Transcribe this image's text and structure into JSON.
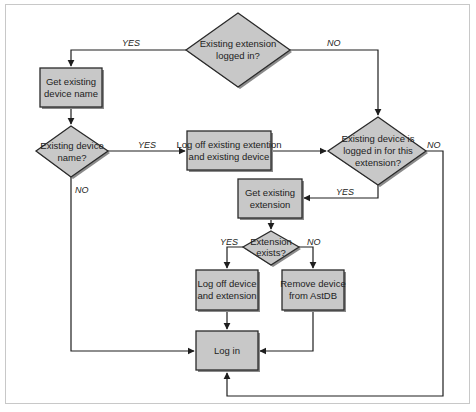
{
  "diagram": {
    "type": "flowchart",
    "colors": {
      "node_fill": "#c8c8c8",
      "node_stroke": "#2a2a2a",
      "shadow": "#8a8a8a",
      "edge": "#1e1e1e",
      "frame_border": "#c8c8c8",
      "background": "#ffffff"
    },
    "nodes": {
      "d_ext_logged_in": {
        "shape": "diamond",
        "lines": [
          "Existing extension",
          "logged in?"
        ]
      },
      "p_get_device_name": {
        "shape": "process",
        "lines": [
          "Get existing",
          "device name"
        ]
      },
      "d_device_name": {
        "shape": "diamond",
        "lines": [
          "Existing device",
          "name?"
        ]
      },
      "p_logoff_ext_device": {
        "shape": "process",
        "lines": [
          "Log off existing extention",
          "and existing device"
        ]
      },
      "d_device_logged_in": {
        "shape": "diamond",
        "lines": [
          "Existing device is",
          "logged in for this",
          "extension?"
        ]
      },
      "p_get_extension": {
        "shape": "process",
        "lines": [
          "Get existing",
          "extension"
        ]
      },
      "d_ext_exists": {
        "shape": "diamond",
        "lines": [
          "Extension",
          "exists?"
        ]
      },
      "p_logoff_device_ext": {
        "shape": "process",
        "lines": [
          "Log off device",
          "and extension"
        ]
      },
      "p_remove_device": {
        "shape": "process",
        "lines": [
          "Remove device",
          "from AstDB"
        ]
      },
      "p_log_in": {
        "shape": "process",
        "lines": [
          "Log in"
        ]
      }
    },
    "edges": [
      {
        "from": "d_ext_logged_in",
        "to": "p_get_device_name",
        "label": "YES"
      },
      {
        "from": "d_ext_logged_in",
        "to": "d_device_logged_in",
        "label": "NO"
      },
      {
        "from": "p_get_device_name",
        "to": "d_device_name",
        "label": ""
      },
      {
        "from": "d_device_name",
        "to": "p_logoff_ext_device",
        "label": "YES"
      },
      {
        "from": "d_device_name",
        "to": "p_log_in",
        "label": "NO"
      },
      {
        "from": "p_logoff_ext_device",
        "to": "d_device_logged_in",
        "label": ""
      },
      {
        "from": "d_device_logged_in",
        "to": "p_get_extension",
        "label": "YES"
      },
      {
        "from": "d_device_logged_in",
        "to": "p_log_in",
        "label": "NO"
      },
      {
        "from": "p_get_extension",
        "to": "d_ext_exists",
        "label": ""
      },
      {
        "from": "d_ext_exists",
        "to": "p_logoff_device_ext",
        "label": "YES"
      },
      {
        "from": "d_ext_exists",
        "to": "p_remove_device",
        "label": "NO"
      },
      {
        "from": "p_logoff_device_ext",
        "to": "p_log_in",
        "label": ""
      },
      {
        "from": "p_remove_device",
        "to": "p_log_in",
        "label": ""
      }
    ],
    "labels": {
      "yes": "YES",
      "no": "NO"
    }
  }
}
